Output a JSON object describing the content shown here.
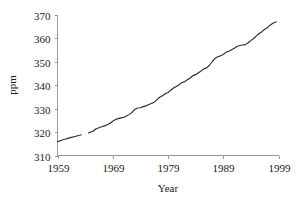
{
  "chart_data": {
    "type": "line",
    "title": "",
    "xlabel": "Year",
    "ylabel": "ppm",
    "xlim": [
      1959,
      1999
    ],
    "ylim": [
      310,
      370
    ],
    "grid": false,
    "legend": false,
    "xticks": [
      1959,
      1969,
      1979,
      1989,
      1999
    ],
    "xtick_labels": [
      "1959",
      "1969",
      "1979",
      "1989",
      "1999"
    ],
    "yticks": [
      310,
      320,
      330,
      340,
      350,
      360,
      370
    ],
    "ytick_labels": [
      "310",
      "320",
      "330",
      "340",
      "350",
      "360",
      "370"
    ],
    "series": [
      {
        "name": "CO2 concentration",
        "color": "#2b2b2b",
        "segments": [
          {
            "name": "segment-1",
            "x": [
              1959.0,
              1959.5,
              1960.0,
              1960.5,
              1961.0,
              1961.5,
              1962.0,
              1962.5,
              1963.0,
              1963.3
            ],
            "y": [
              315.9,
              316.3,
              316.7,
              317.0,
              317.4,
              317.7,
              318.0,
              318.3,
              318.6,
              318.8
            ]
          },
          {
            "name": "segment-2",
            "x": [
              1964.6,
              1965.0,
              1965.5,
              1966.0,
              1966.5,
              1967.0,
              1967.5,
              1968.0,
              1968.5,
              1969.0,
              1969.5,
              1970.0,
              1970.5,
              1971.0,
              1971.5,
              1972.0,
              1972.5,
              1973.0,
              1973.5,
              1974.0,
              1974.5,
              1975.0,
              1975.5,
              1976.0,
              1976.5,
              1977.0,
              1977.5,
              1978.0,
              1978.5,
              1979.0,
              1979.5,
              1980.0,
              1980.5,
              1981.0,
              1981.5,
              1982.0,
              1982.5,
              1983.0,
              1983.5,
              1984.0,
              1984.5,
              1985.0,
              1985.5,
              1986.0,
              1986.5,
              1987.0,
              1987.5,
              1988.0,
              1988.5,
              1989.0,
              1989.5,
              1990.0,
              1990.5,
              1991.0,
              1991.5,
              1992.0,
              1992.5,
              1993.0,
              1993.5,
              1994.0,
              1994.5,
              1995.0,
              1995.5,
              1996.0,
              1996.5,
              1997.0,
              1997.5,
              1998.0,
              1998.6
            ],
            "y": [
              319.6,
              320.0,
              320.4,
              321.4,
              321.8,
              322.2,
              322.6,
              323.1,
              323.7,
              324.6,
              325.3,
              325.7,
              326.0,
              326.3,
              326.8,
              327.5,
              328.3,
              329.7,
              330.2,
              330.3,
              330.8,
              331.1,
              331.7,
              332.1,
              332.7,
              333.8,
              334.8,
              335.4,
              336.3,
              336.8,
              337.8,
              338.7,
              339.4,
              340.1,
              341.0,
              341.4,
              342.2,
              343.0,
              344.0,
              344.4,
              345.2,
              346.0,
              346.9,
              347.3,
              348.4,
              349.9,
              351.3,
              352.0,
              352.4,
              353.0,
              353.9,
              354.4,
              355.0,
              355.6,
              356.4,
              356.8,
              357.0,
              357.2,
              358.0,
              358.9,
              359.8,
              360.9,
              361.9,
              362.7,
              363.7,
              364.4,
              365.5,
              366.3,
              366.9
            ]
          }
        ]
      }
    ]
  }
}
